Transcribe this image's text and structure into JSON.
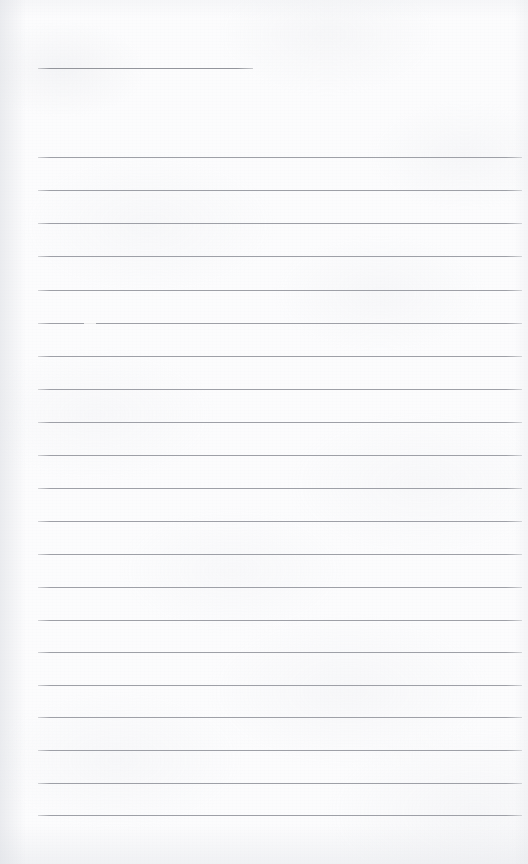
{
  "document": {
    "type": "scanned-lined-page",
    "description": "Blank ruled notebook page scan",
    "page_width": 528,
    "page_height": 864,
    "paper_color": "#fcfcfd",
    "rule_color": "#9a9ca3",
    "rule_left_x": 38,
    "rule_right_x": 522,
    "rule_spacing": 33,
    "content_text": ""
  },
  "header_rule": {
    "label": "title-underline",
    "y": 68,
    "x_start": 38,
    "x_end": 253,
    "length": 215
  },
  "rules": [
    {
      "index": 1,
      "y": 157,
      "x_start": 38,
      "x_end": 522
    },
    {
      "index": 2,
      "y": 190,
      "x_start": 38,
      "x_end": 522
    },
    {
      "index": 3,
      "y": 223,
      "x_start": 38,
      "x_end": 522
    },
    {
      "index": 4,
      "y": 256,
      "x_start": 38,
      "x_end": 522
    },
    {
      "index": 5,
      "y": 290,
      "x_start": 38,
      "x_end": 522
    },
    {
      "index": 6,
      "y": 323,
      "x_start": 38,
      "x_end": 522
    },
    {
      "index": 7,
      "y": 356,
      "x_start": 38,
      "x_end": 522
    },
    {
      "index": 8,
      "y": 389,
      "x_start": 38,
      "x_end": 522
    },
    {
      "index": 9,
      "y": 422,
      "x_start": 38,
      "x_end": 522
    },
    {
      "index": 10,
      "y": 455,
      "x_start": 38,
      "x_end": 522
    },
    {
      "index": 11,
      "y": 488,
      "x_start": 38,
      "x_end": 522
    },
    {
      "index": 12,
      "y": 521,
      "x_start": 38,
      "x_end": 522
    },
    {
      "index": 13,
      "y": 554,
      "x_start": 38,
      "x_end": 522
    },
    {
      "index": 14,
      "y": 587,
      "x_start": 38,
      "x_end": 522
    },
    {
      "index": 15,
      "y": 620,
      "x_start": 38,
      "x_end": 522
    },
    {
      "index": 16,
      "y": 652,
      "x_start": 38,
      "x_end": 522
    },
    {
      "index": 17,
      "y": 685,
      "x_start": 38,
      "x_end": 522
    },
    {
      "index": 18,
      "y": 717,
      "x_start": 38,
      "x_end": 522
    },
    {
      "index": 19,
      "y": 750,
      "x_start": 38,
      "x_end": 522
    },
    {
      "index": 20,
      "y": 783,
      "x_start": 38,
      "x_end": 522
    },
    {
      "index": 21,
      "y": 815,
      "x_start": 38,
      "x_end": 522
    }
  ],
  "artifacts": [
    {
      "name": "rule-break",
      "on_rule_index": 6,
      "x": 84,
      "y": 322,
      "width": 12
    }
  ]
}
